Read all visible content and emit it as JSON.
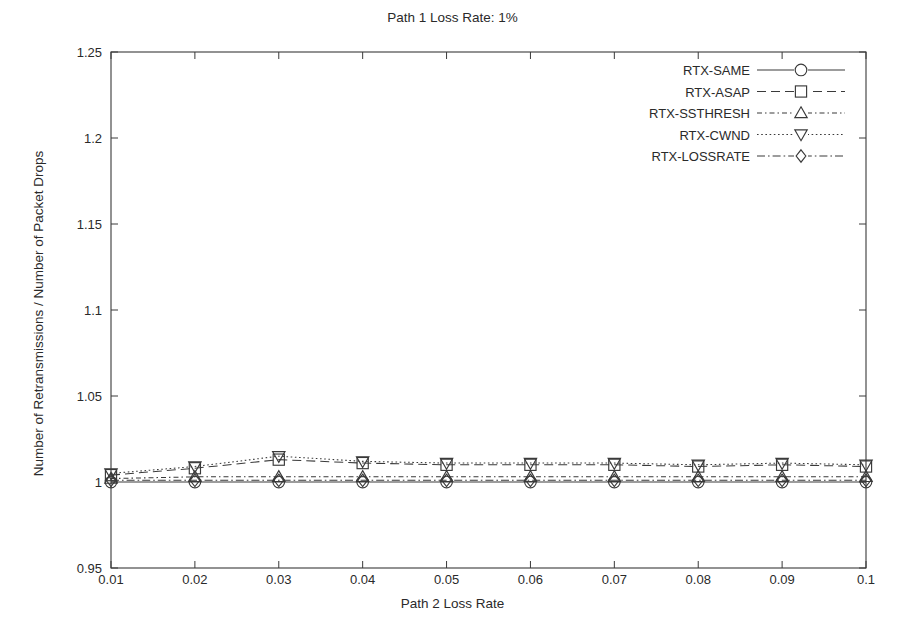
{
  "chart_data": {
    "type": "line",
    "title": "Path 1 Loss Rate: 1%",
    "xlabel": "Path 2 Loss Rate",
    "ylabel": "Number of Retransmissions / Number of Packet Drops",
    "x": [
      0.01,
      0.02,
      0.03,
      0.04,
      0.05,
      0.06,
      0.07,
      0.08,
      0.09,
      0.1
    ],
    "xtick_labels": [
      "0.01",
      "0.02",
      "0.03",
      "0.04",
      "0.05",
      "0.06",
      "0.07",
      "0.08",
      "0.09",
      "0.1"
    ],
    "ytick_labels": [
      "0.95",
      "1",
      "1.05",
      "1.1",
      "1.15",
      "1.2",
      "1.25"
    ],
    "yticks": [
      0.95,
      1.0,
      1.05,
      1.1,
      1.15,
      1.2,
      1.25
    ],
    "xlim": [
      0.01,
      0.1
    ],
    "ylim": [
      0.95,
      1.25
    ],
    "grid": false,
    "legend_position": "top-right",
    "series": [
      {
        "name": "RTX-SAME",
        "marker": "circle",
        "linestyle": "solid",
        "values": [
          1.0,
          1.0,
          1.0,
          1.0,
          1.0,
          1.0,
          1.0,
          1.0,
          1.0,
          1.0
        ]
      },
      {
        "name": "RTX-ASAP",
        "marker": "square",
        "linestyle": "dashed",
        "values": [
          1.004,
          1.008,
          1.013,
          1.011,
          1.01,
          1.01,
          1.01,
          1.009,
          1.01,
          1.009
        ]
      },
      {
        "name": "RTX-SSTHRESH",
        "marker": "triangle-up",
        "linestyle": "dash-dot-fine",
        "values": [
          1.002,
          1.003,
          1.003,
          1.003,
          1.003,
          1.003,
          1.003,
          1.003,
          1.003,
          1.003
        ]
      },
      {
        "name": "RTX-CWND",
        "marker": "triangle-down",
        "linestyle": "dotted",
        "values": [
          1.005,
          1.009,
          1.015,
          1.012,
          1.011,
          1.011,
          1.011,
          1.01,
          1.011,
          1.01
        ]
      },
      {
        "name": "RTX-LOSSRATE",
        "marker": "diamond",
        "linestyle": "dash-dot",
        "values": [
          1.001,
          1.001,
          1.001,
          1.001,
          1.001,
          1.001,
          1.001,
          1.001,
          1.001,
          1.001
        ]
      }
    ]
  }
}
